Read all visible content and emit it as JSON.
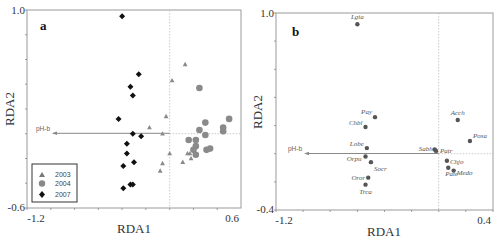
{
  "chart_data": [
    {
      "panel": "a",
      "type": "scatter",
      "title": "a",
      "xlabel": "RDA1",
      "ylabel": "RDA2",
      "xlim": [
        -1.2,
        0.6
      ],
      "ylim": [
        -0.6,
        1.0
      ],
      "x_tick_labels": [
        "-1.2",
        "0.6"
      ],
      "y_tick_labels": [
        "1.0",
        "-0.6"
      ],
      "grid": false,
      "legend_position": "lower-left",
      "vector": {
        "label": "pH-b",
        "from": [
          0,
          0
        ],
        "to": [
          -1.0,
          0
        ]
      },
      "series": [
        {
          "name": "2003",
          "marker": "triangle",
          "color": "#8a8a8a",
          "points": [
            [
              0.13,
              0.56
            ],
            [
              0.02,
              0.43
            ],
            [
              -0.03,
              0.14
            ],
            [
              -0.17,
              0.05
            ],
            [
              -0.06,
              0.0
            ],
            [
              0.0,
              -0.16
            ],
            [
              0.11,
              -0.23
            ],
            [
              -0.06,
              -0.24
            ],
            [
              -0.08,
              -0.3
            ],
            [
              0.17,
              -0.16
            ],
            [
              0.15,
              -0.16
            ],
            [
              0.18,
              -0.2
            ]
          ]
        },
        {
          "name": "2004",
          "marker": "circle",
          "color": "#8a8a8a",
          "points": [
            [
              0.25,
              0.37
            ],
            [
              0.3,
              0.09
            ],
            [
              0.25,
              0.03
            ],
            [
              0.3,
              -0.01
            ],
            [
              0.16,
              -0.05
            ],
            [
              0.22,
              -0.05
            ],
            [
              0.22,
              -0.1
            ],
            [
              0.2,
              -0.13
            ],
            [
              0.22,
              -0.17
            ],
            [
              0.31,
              -0.13
            ],
            [
              0.34,
              -0.12
            ],
            [
              0.5,
              0.12
            ],
            [
              0.45,
              0.05
            ],
            [
              0.45,
              0.02
            ]
          ]
        },
        {
          "name": "2007",
          "marker": "diamond",
          "color": "#111111",
          "points": [
            [
              -0.4,
              0.95
            ],
            [
              -0.26,
              0.48
            ],
            [
              -0.33,
              0.38
            ],
            [
              -0.31,
              0.31
            ],
            [
              -0.43,
              0.12
            ],
            [
              -0.31,
              0.0
            ],
            [
              -0.24,
              -0.02
            ],
            [
              -0.36,
              -0.08
            ],
            [
              -0.36,
              -0.16
            ],
            [
              -0.39,
              -0.26
            ],
            [
              -0.3,
              -0.23
            ],
            [
              -0.39,
              -0.44
            ],
            [
              -0.33,
              -0.41
            ],
            [
              -0.31,
              -0.41
            ]
          ]
        }
      ]
    },
    {
      "panel": "b",
      "type": "scatter",
      "title": "b",
      "xlabel": "RDA1",
      "ylabel": "RDA2",
      "xlim": [
        -1.2,
        0.4
      ],
      "ylim": [
        -0.4,
        1.0
      ],
      "x_tick_labels": [
        "-1.2",
        "0.4"
      ],
      "y_tick_labels": [
        "1.0",
        "-0.4"
      ],
      "grid": false,
      "vector": {
        "label": "pH-b",
        "from": [
          0,
          0
        ],
        "to": [
          -0.99,
          0
        ]
      },
      "points": [
        {
          "label": "Lgia",
          "x": -0.6,
          "y": 0.92
        },
        {
          "label": "Pay",
          "x": -0.47,
          "y": 0.26
        },
        {
          "label": "Chbl",
          "x": -0.54,
          "y": 0.19
        },
        {
          "label": "Lobe",
          "x": -0.53,
          "y": 0.04
        },
        {
          "label": "Orpu",
          "x": -0.54,
          "y": -0.02
        },
        {
          "label": "Socr",
          "x": -0.5,
          "y": -0.06
        },
        {
          "label": "Oror",
          "x": -0.52,
          "y": -0.17
        },
        {
          "label": "Trca",
          "x": -0.54,
          "y": -0.22
        },
        {
          "label": "Sabh",
          "x": -0.03,
          "y": 0.03
        },
        {
          "label": "Patr",
          "x": -0.02,
          "y": 0.02
        },
        {
          "label": "Chjo",
          "x": 0.06,
          "y": -0.05
        },
        {
          "label": "Pate",
          "x": 0.07,
          "y": -0.1
        },
        {
          "label": "Medo",
          "x": 0.11,
          "y": -0.12
        },
        {
          "label": "Acch",
          "x": 0.14,
          "y": 0.24
        },
        {
          "label": "Posa",
          "x": 0.23,
          "y": 0.09
        }
      ]
    }
  ],
  "panels": {
    "a": {
      "letter": "a",
      "xlabel": "RDA1",
      "ylabel": "RDA2",
      "xmin_label": "-1.2",
      "xmax_label": "0.6",
      "ymax_label": "1.0",
      "ymin_label": "-0.6",
      "vector_label": "pH-b",
      "legend": [
        {
          "label": "2003",
          "marker": "triangle"
        },
        {
          "label": "2004",
          "marker": "circle"
        },
        {
          "label": "2007",
          "marker": "diamond"
        }
      ]
    },
    "b": {
      "letter": "b",
      "xlabel": "RDA1",
      "ylabel": "RDA2",
      "xmin_label": "-1.2",
      "xmax_label": "0.4",
      "ymax_label": "1.0",
      "ymin_label": "-0.4",
      "vector_label": "pH-b"
    }
  },
  "colors": {
    "frame": "#9a9a9a",
    "grey_marker": "#8a8a8a",
    "dark_marker": "#111111",
    "axis_line": "#888888"
  }
}
